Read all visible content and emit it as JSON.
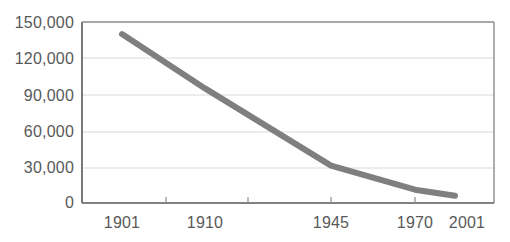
{
  "chart_data": {
    "type": "line",
    "title": "",
    "subtitle": "",
    "xlabel": "",
    "ylabel": "",
    "categories": [
      "1901",
      "1910",
      "1945",
      "1970",
      "2001"
    ],
    "x": [
      1901,
      1910,
      1945,
      1970,
      2001
    ],
    "values": [
      140000,
      95000,
      31000,
      11000,
      6000
    ],
    "series": [
      {
        "name": "",
        "values": [
          140000,
          95000,
          31000,
          11000,
          6000
        ]
      }
    ],
    "ylim": [
      0,
      150000
    ],
    "yticks": [
      0,
      30000,
      60000,
      90000,
      120000,
      150000
    ],
    "ytick_labels": [
      "0",
      "30,000",
      "60,000",
      "90,000",
      "120,000",
      "150,000"
    ],
    "xtick_labels": [
      "1901",
      "1910",
      "1945",
      "1970",
      "2001"
    ],
    "grid": true,
    "grid_axis": "y",
    "legend": false,
    "legend_position": "none",
    "annotations": [],
    "line_color": "#7f7f7f",
    "grid_color": "#d9d9d9",
    "axis_color": "#595959",
    "text_color": "#595959",
    "background_color": "#ffffff"
  },
  "axis": {
    "y_labels": [
      {
        "text": "150,000",
        "top": 15
      },
      {
        "text": "120,000",
        "top": 51
      },
      {
        "text": "90,000",
        "top": 88
      },
      {
        "text": "60,000",
        "top": 124
      },
      {
        "text": "30,000",
        "top": 160
      },
      {
        "text": "0",
        "top": 195
      }
    ],
    "x_labels": [
      {
        "text": "1901",
        "left": 122
      },
      {
        "text": "1910",
        "left": 205
      },
      {
        "text": "1945",
        "left": 331
      },
      {
        "text": "1970",
        "left": 415
      },
      {
        "text": "2001",
        "left": 467
      }
    ]
  }
}
